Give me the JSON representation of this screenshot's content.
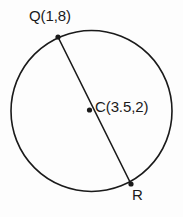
{
  "figure": {
    "type": "circle-with-diameter",
    "background_color": "#fdfdfd",
    "stroke_color": "#1a1a1a",
    "text_color": "#1a1a1a",
    "point_color": "#1a1a1a"
  },
  "labels": {
    "q": "Q(1,8)",
    "c": "C(3.5,2)",
    "r": "R"
  },
  "geometry": {
    "circle": {
      "center_x": 91.5,
      "center_y": 111,
      "radius": 80.5,
      "stroke_width": 1.6
    },
    "diameter": {
      "x1": 58,
      "y1": 37,
      "x2": 131,
      "y2": 184,
      "stroke_width": 1.6
    },
    "points": [
      {
        "name": "Q",
        "x": 58,
        "y": 37,
        "radius": 2.6
      },
      {
        "name": "C",
        "x": 89.5,
        "y": 110,
        "radius": 2.6
      },
      {
        "name": "R",
        "x": 131,
        "y": 184,
        "radius": 2.6
      }
    ]
  },
  "coordinates": {
    "q_point": {
      "x": 1,
      "y": 8
    },
    "c_point": {
      "x": 3.5,
      "y": 2
    }
  }
}
